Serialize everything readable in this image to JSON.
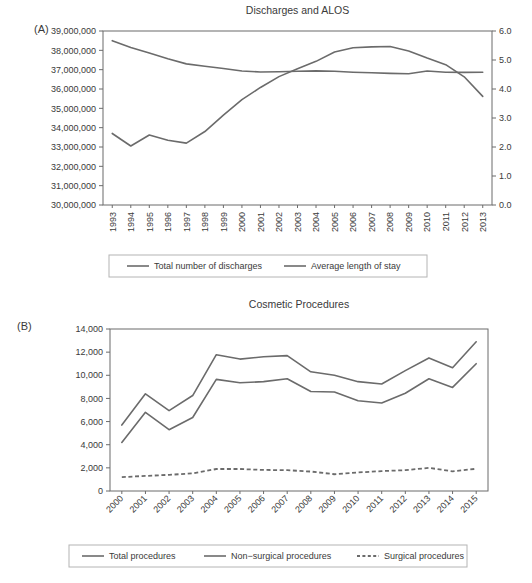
{
  "figure": {
    "panel_a_label": "(A)",
    "panel_b_label": "(B)"
  },
  "chart_data": [
    {
      "id": "panel_a",
      "type": "line",
      "title": "Discharges and ALOS",
      "xlabel": "",
      "ylabel": "",
      "grid": false,
      "legend_position": "bottom",
      "categories": [
        "1993",
        "1994",
        "1995",
        "1996",
        "1997",
        "1998",
        "1999",
        "2000",
        "2001",
        "2002",
        "2003",
        "2004",
        "2005",
        "2006",
        "2007",
        "2008",
        "2009",
        "2010",
        "2011",
        "2012",
        "2013"
      ],
      "ylim": [
        30000000,
        39000000
      ],
      "yticks": [
        30000000,
        31000000,
        32000000,
        33000000,
        34000000,
        35000000,
        36000000,
        37000000,
        38000000,
        39000000
      ],
      "ytick_labels": [
        "30,000,000",
        "31,000,000",
        "32,000,000",
        "33,000,000",
        "34,000,000",
        "35,000,000",
        "36,000,000",
        "37,000,000",
        "38,000,000",
        "39,000,000"
      ],
      "y2lim": [
        0.0,
        6.0
      ],
      "y2ticks": [
        0.0,
        1.0,
        2.0,
        3.0,
        4.0,
        5.0,
        6.0
      ],
      "y2tick_labels": [
        "0.0",
        "1.0",
        "2.0",
        "3.0",
        "4.0",
        "5.0",
        "6.0"
      ],
      "series": [
        {
          "name": "Total number of discharges",
          "axis": "right",
          "style": "solid",
          "values": [
            33700000,
            33050000,
            33620000,
            33350000,
            33200000,
            33800000,
            34650000,
            35450000,
            36080000,
            36640000,
            37050000,
            37430000,
            37910000,
            38130000,
            38180000,
            38200000,
            37970000,
            37600000,
            37260000,
            36630000,
            35620000
          ]
        },
        {
          "name": "Average length of stay",
          "axis": "left",
          "style": "solid",
          "values": [
            38500000,
            38150000,
            37860000,
            37560000,
            37300000,
            37180000,
            37060000,
            36930000,
            36880000,
            36890000,
            36920000,
            36940000,
            36920000,
            36870000,
            36840000,
            36810000,
            36790000,
            36930000,
            36870000,
            36860000,
            36870000
          ]
        }
      ],
      "legend": [
        {
          "label": "Total number of discharges",
          "style": "solid"
        },
        {
          "label": "Average length of stay",
          "style": "solid"
        }
      ]
    },
    {
      "id": "panel_b",
      "type": "line",
      "title": "Cosmetic Procedures",
      "xlabel": "",
      "ylabel": "",
      "grid": false,
      "legend_position": "bottom",
      "categories": [
        "2000",
        "2001",
        "2002",
        "2003",
        "2004",
        "2005",
        "2006",
        "2007",
        "2008",
        "2009",
        "2010",
        "2011",
        "2012",
        "2013",
        "2014",
        "2015"
      ],
      "ylim": [
        0,
        14000
      ],
      "yticks": [
        0,
        2000,
        4000,
        6000,
        8000,
        10000,
        12000,
        14000
      ],
      "ytick_labels": [
        "0",
        "2,000",
        "4,000",
        "6,000",
        "8,000",
        "10,000",
        "12,000",
        "14,000"
      ],
      "series": [
        {
          "name": "Total procedures",
          "style": "solid",
          "values": [
            5700,
            8400,
            6950,
            8250,
            11780,
            11400,
            11600,
            11700,
            10300,
            10000,
            9450,
            9250,
            10400,
            11500,
            10650,
            12900
          ]
        },
        {
          "name": "Non-surgical procedures",
          "style": "solid",
          "values": [
            4200,
            6800,
            5300,
            6350,
            9650,
            9350,
            9450,
            9700,
            8600,
            8550,
            7800,
            7600,
            8450,
            9700,
            8950,
            11000
          ]
        },
        {
          "name": "Surgical procedures",
          "style": "dashed",
          "values": [
            1200,
            1300,
            1400,
            1520,
            1900,
            1900,
            1820,
            1800,
            1680,
            1450,
            1600,
            1720,
            1800,
            2000,
            1700,
            1920
          ]
        }
      ],
      "legend": [
        {
          "label": "Total procedures",
          "style": "solid"
        },
        {
          "label": "Non−surgical procedures",
          "style": "solid"
        },
        {
          "label": "Surgical procedures",
          "style": "dashed"
        }
      ]
    }
  ]
}
